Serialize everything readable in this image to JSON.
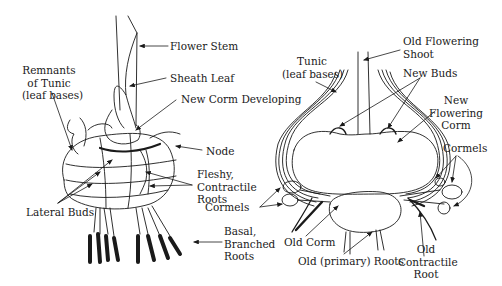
{
  "figure": {
    "colors": {
      "ink": "#1a1a1a",
      "background": "#ffffff"
    }
  },
  "left_diagram": {
    "labels": {
      "flower_stem": "Flower Stem",
      "sheath_leaf": "Sheath Leaf",
      "remnants_line1": "Remnants",
      "remnants_line2": "of Tunic",
      "remnants_line3": "(leaf bases)",
      "new_corm": "New Corm Developing",
      "node": "Node",
      "fleshy_line1": "Fleshy,",
      "fleshy_line2": "Contractile",
      "fleshy_line3": "Roots",
      "lateral_buds": "Lateral Buds",
      "basal_line1": "Basal,",
      "basal_line2": "Branched",
      "basal_line3": "Roots"
    }
  },
  "right_diagram": {
    "labels": {
      "old_flowering_line1": "Old Flowering",
      "old_flowering_line2": "Shoot",
      "tunic_line1": "Tunic",
      "tunic_line2": "(leaf bases)",
      "new_buds": "New Buds",
      "new_flowering_line1": "New",
      "new_flowering_line2": "Flowering",
      "new_flowering_line3": "Corm",
      "cormels_right": "Cormels",
      "cormels_left": "Cormels",
      "old_corm": "Old Corm",
      "old_primary_roots": "Old (primary) Roots",
      "old_contractile_line1": "Old",
      "old_contractile_line2": "Contractile",
      "old_contractile_line3": "Root"
    }
  }
}
